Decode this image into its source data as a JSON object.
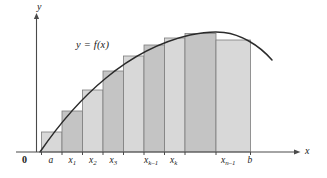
{
  "figure": {
    "background_color": "#ffffff",
    "curve_color": "#2b2b2b",
    "axis_color": "#4a4a4a",
    "bar_fill_light": "#d8d8d8",
    "bar_fill_dark": "#c4c4c4",
    "bar_stroke": "#7d7d7d"
  },
  "labels": {
    "y_axis": "y",
    "x_axis": "x",
    "origin": "0",
    "function": "y = f(x)"
  },
  "ticks": [
    {
      "id": "a",
      "text": "a",
      "sub": "",
      "x": 51.5
    },
    {
      "id": "x1",
      "text": "x",
      "sub": "1",
      "x": 71.5
    },
    {
      "id": "x2",
      "text": "x",
      "sub": "2",
      "x": 92.0
    },
    {
      "id": "x3",
      "text": "x",
      "sub": "3",
      "x": 112.5
    },
    {
      "id": "xk1",
      "text": "x",
      "sub": "k–1",
      "x": 147.0
    },
    {
      "id": "xk",
      "text": "x",
      "sub": "k",
      "x": 173.0
    },
    {
      "id": "xn1",
      "text": "x",
      "sub": "n–1",
      "x": 224.0
    },
    {
      "id": "b",
      "text": "b",
      "sub": "",
      "x": 250.5
    }
  ],
  "chart_data": {
    "type": "bar",
    "xlabel": "x",
    "ylabel": "y",
    "grid": false,
    "legend": null,
    "axes": {
      "x_axis_pixel_y": 152,
      "y_axis_pixel_x": 36.5,
      "x_axis_end_pixel_x": 300,
      "y_axis_top_pixel_y": 14
    },
    "categories": [
      "a",
      "x1",
      "x2",
      "x3",
      "x4",
      "xk-1",
      "xk",
      "xk+1",
      "xn-1"
    ],
    "tick_positions_px": [
      41.5,
      62.0,
      82.5,
      103.0,
      123.5,
      144.0,
      164.5,
      185.0,
      216.0,
      250.5
    ],
    "bars": [
      {
        "index": 1,
        "x0": 41.5,
        "x1": 62.0,
        "top_y": 132.0,
        "height_px": 20.0,
        "shade": "light"
      },
      {
        "index": 2,
        "x0": 62.0,
        "x1": 82.5,
        "top_y": 111.0,
        "height_px": 41.0,
        "shade": "dark"
      },
      {
        "index": 3,
        "x0": 82.5,
        "x1": 103.0,
        "top_y": 90.0,
        "height_px": 62.0,
        "shade": "light"
      },
      {
        "index": 4,
        "x0": 103.0,
        "x1": 123.5,
        "top_y": 71.0,
        "height_px": 81.0,
        "shade": "dark"
      },
      {
        "index": 5,
        "x0": 123.5,
        "x1": 144.0,
        "top_y": 56.0,
        "height_px": 96.0,
        "shade": "light"
      },
      {
        "index": 6,
        "x0": 144.0,
        "x1": 164.5,
        "top_y": 45.0,
        "height_px": 107.0,
        "shade": "dark"
      },
      {
        "index": 7,
        "x0": 164.5,
        "x1": 185.0,
        "top_y": 38.0,
        "height_px": 114.0,
        "shade": "light"
      },
      {
        "index": 8,
        "x0": 185.0,
        "x1": 216.0,
        "top_y": 33.5,
        "height_px": 118.5,
        "shade": "dark"
      },
      {
        "index": 9,
        "x0": 216.0,
        "x1": 250.5,
        "top_y": 40.0,
        "height_px": 112.0,
        "shade": "light"
      }
    ],
    "curve": {
      "description": "concave-down curve rising from the x-axis near x=40, peaking near x=218, descending to x=272",
      "path": "M 40 152 C 62 120, 84 96, 106 78 C 130 58, 160 42, 190 35 C 205 32, 215 31.5, 224 32.5 C 240 34.5, 258 44, 272 60"
    }
  }
}
